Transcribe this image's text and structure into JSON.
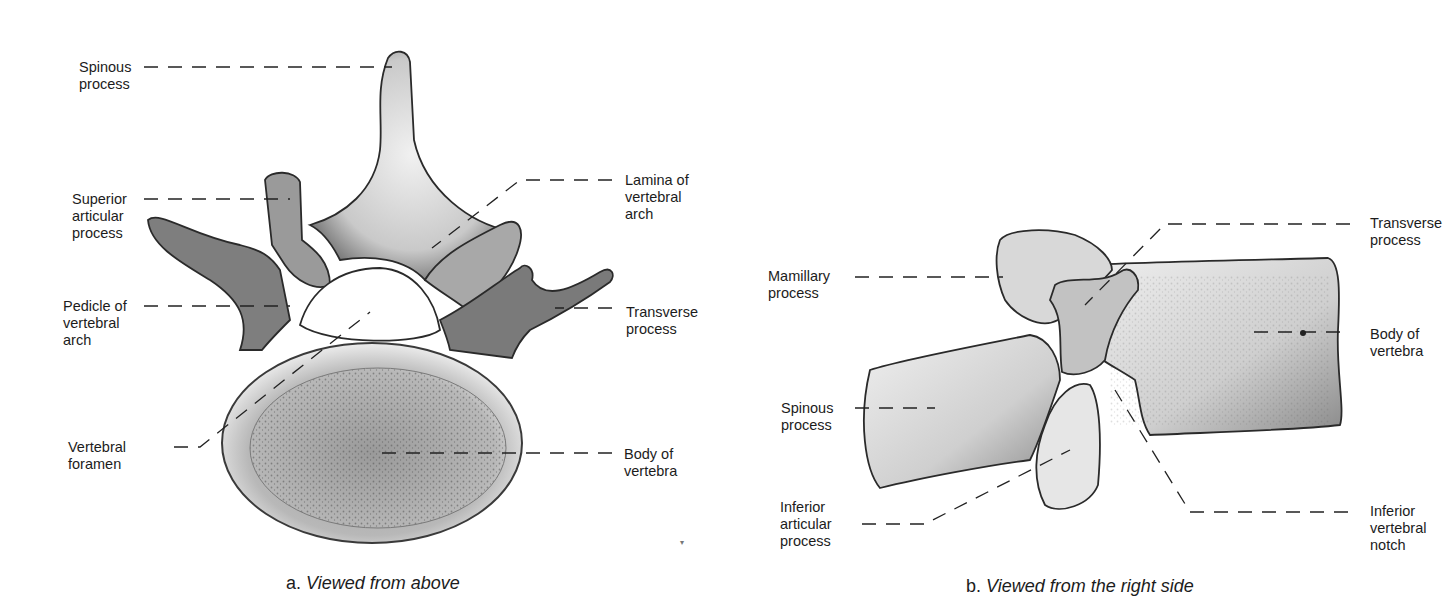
{
  "figure_a": {
    "caption_prefix": "a.",
    "caption_text": "Viewed from above",
    "labels": {
      "spinous_process": "Spinous\nprocess",
      "superior_articular_process": "Superior\narticular\nprocess",
      "pedicle_of_vertebral_arch": "Pedicle of\nvertebral\narch",
      "vertebral_foramen": "Vertebral\nforamen",
      "lamina_of_vertebral_arch": "Lamina of\nvertebral\narch",
      "transverse_process": "Transverse\nprocess",
      "body_of_vertebra": "Body of\nvertebra"
    }
  },
  "figure_b": {
    "caption_prefix": "b.",
    "caption_text": "Viewed from the right side",
    "labels": {
      "mamillary_process": "Mamillary\nprocess",
      "spinous_process": "Spinous\nprocess",
      "inferior_articular_process": "Inferior\narticular\nprocess",
      "transverse_process": "Transverse\nprocess",
      "body_of_vertebra": "Body of\nvertebra",
      "inferior_vertebral_notch": "Inferior\nvertebral\nnotch"
    }
  }
}
